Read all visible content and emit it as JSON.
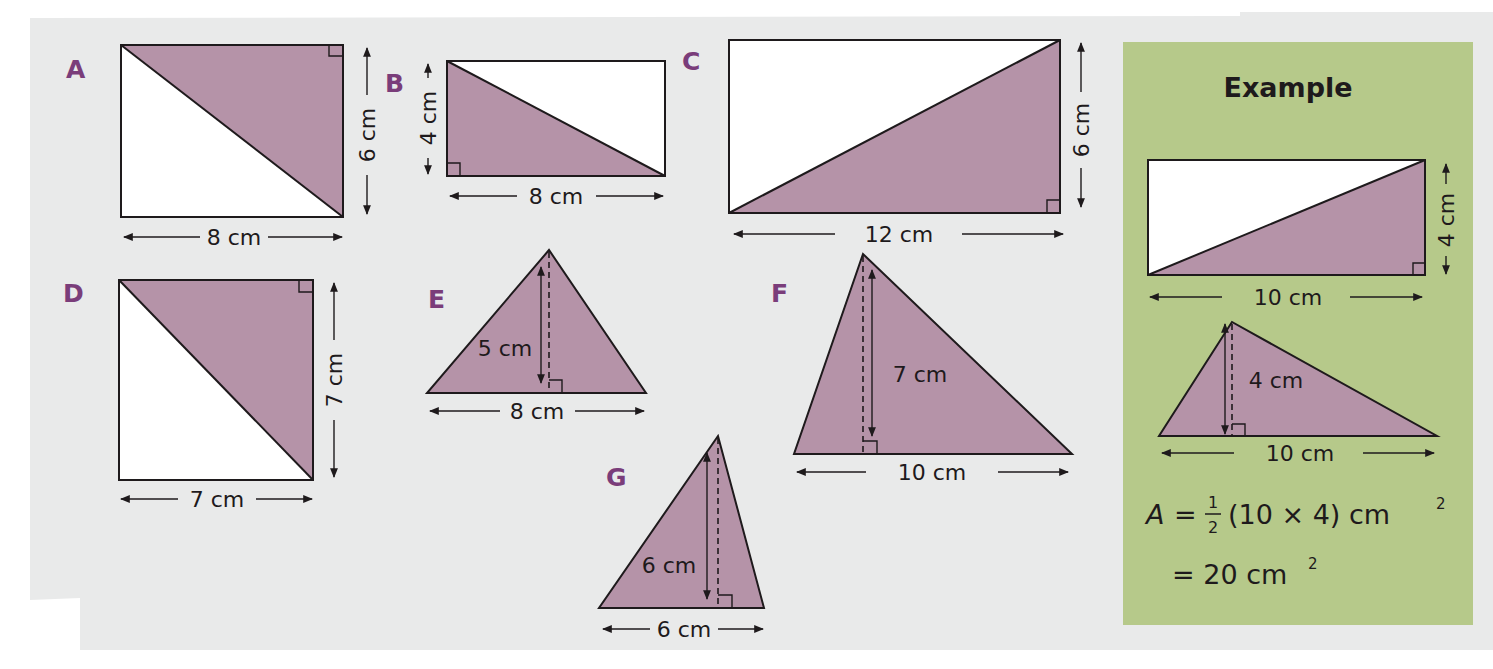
{
  "colors": {
    "page_background": "#e9eaea",
    "example_panel": "#b6c98a",
    "shaded_triangle": "#b593a8",
    "label_purple": "#7a3d7a",
    "line": "#1e1a1c"
  },
  "shapes": {
    "A": {
      "label": "A",
      "type": "rectangle-with-shaded-right-triangle",
      "width_label": "8 cm",
      "height_label": "6 cm"
    },
    "B": {
      "label": "B",
      "type": "rectangle-with-shaded-right-triangle",
      "width_label": "8 cm",
      "height_label": "4 cm"
    },
    "C": {
      "label": "C",
      "type": "rectangle-with-shaded-right-triangle",
      "width_label": "12 cm",
      "height_label": "6 cm"
    },
    "D": {
      "label": "D",
      "type": "square-with-shaded-right-triangle",
      "width_label": "7 cm",
      "height_label": "7 cm"
    },
    "E": {
      "label": "E",
      "type": "triangle-with-height",
      "base_label": "8 cm",
      "height_label": "5 cm"
    },
    "F": {
      "label": "F",
      "type": "triangle-with-height",
      "base_label": "10 cm",
      "height_label": "7 cm"
    },
    "G": {
      "label": "G",
      "type": "triangle-with-height",
      "base_label": "6 cm",
      "height_label": "6 cm"
    }
  },
  "example": {
    "title": "Example",
    "rectangle": {
      "width_label": "10 cm",
      "height_label": "4 cm"
    },
    "triangle": {
      "base_label": "10 cm",
      "height_label": "4 cm"
    },
    "formula": {
      "lhs": "A",
      "equals": "=",
      "frac_num": "1",
      "frac_den": "2",
      "expr": "(10 × 4) cm",
      "expr_exp": "2",
      "result": "= 20 cm",
      "result_exp": "2"
    }
  }
}
